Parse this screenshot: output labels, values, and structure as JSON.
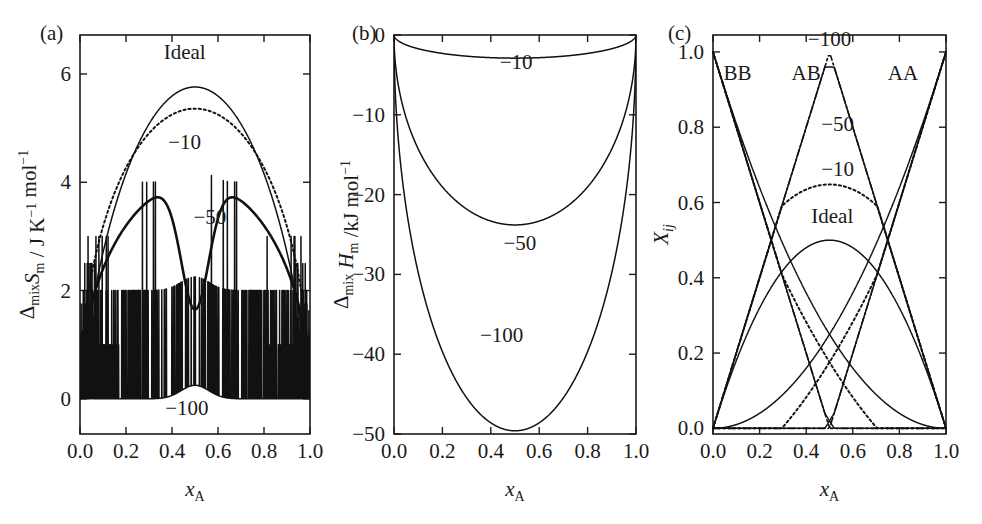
{
  "figure": {
    "background": "#ffffff",
    "line_color": "#111111",
    "partial_caption": ""
  },
  "panels": [
    {
      "id": "a",
      "label": "(a)",
      "xlabel_main": "x",
      "xlabel_sub": "A",
      "ylabel_parts": [
        {
          "text": "Δ",
          "kind": "normal"
        },
        {
          "text": "mix",
          "kind": "sub"
        },
        {
          "text": "S",
          "kind": "ital"
        },
        {
          "text": "m",
          "kind": "sub"
        },
        {
          "text": " / J K",
          "kind": "normal"
        },
        {
          "text": "−1",
          "kind": "sup"
        },
        {
          "text": " mol",
          "kind": "normal"
        },
        {
          "text": "−1",
          "kind": "sup"
        }
      ],
      "ylabel_plain": "Δmix Sm / J K−1 mol−1",
      "xticks": [
        "0.0",
        "0.2",
        "0.4",
        "0.6",
        "0.8",
        "1.0"
      ],
      "xtickvals": [
        0,
        0.2,
        0.4,
        0.6,
        0.8,
        1.0
      ],
      "yticks": [
        "0",
        "2",
        "4",
        "6"
      ],
      "ytickvals": [
        0,
        2,
        4,
        6
      ],
      "xlim": [
        0,
        1
      ],
      "ylim": [
        -0.65,
        6.72
      ],
      "curve_labels": [
        {
          "text": "Ideal",
          "x": 0.455,
          "y": 6.28
        },
        {
          "text": "−10",
          "x": 0.455,
          "y": 4.62
        },
        {
          "text": "−50",
          "x": 0.565,
          "y": 3.22
        },
        {
          "text": "−100",
          "x": 0.465,
          "y": -0.3
        }
      ]
    },
    {
      "id": "b",
      "label": "(b)",
      "xlabel_main": "x",
      "xlabel_sub": "A",
      "ylabel_parts": [
        {
          "text": "Δ",
          "kind": "normal"
        },
        {
          "text": "mix",
          "kind": "sub"
        },
        {
          "text": " H",
          "kind": "ital"
        },
        {
          "text": "m",
          "kind": "sub"
        },
        {
          "text": " /kJ mol",
          "kind": "normal"
        },
        {
          "text": "−1",
          "kind": "sup"
        }
      ],
      "ylabel_plain": "Δmix Hm /kJ mol−1",
      "xticks": [
        "0.0",
        "0.2",
        "0.4",
        "0.6",
        "0.8",
        "1.0"
      ],
      "xtickvals": [
        0,
        0.2,
        0.4,
        0.6,
        0.8,
        1.0
      ],
      "yticks": [
        "0",
        "−10",
        "−20",
        "−30",
        "−40",
        "−50"
      ],
      "ytickvals": [
        0,
        -10,
        -20,
        -30,
        -40,
        -50
      ],
      "xlim": [
        0,
        1
      ],
      "ylim": [
        -50,
        0
      ],
      "curve_labels": [
        {
          "text": "−10",
          "x": 0.505,
          "y": -4.3
        },
        {
          "text": "−50",
          "x": 0.52,
          "y": -27.0
        },
        {
          "text": "−100",
          "x": 0.445,
          "y": -38.5
        }
      ]
    },
    {
      "id": "c",
      "label": "(c)",
      "xlabel_main": "x",
      "xlabel_sub": "A",
      "ylabel_parts": [
        {
          "text": "X",
          "kind": "ital"
        },
        {
          "text": "ij",
          "kind": "subital"
        }
      ],
      "ylabel_plain": "Xij",
      "xticks": [
        "0.0",
        "0.2",
        "0.4",
        "0.6",
        "0.8",
        "1.0"
      ],
      "xtickvals": [
        0,
        0.2,
        0.4,
        0.6,
        0.8,
        1.0
      ],
      "yticks": [
        "0.0",
        "0.2",
        "0.4",
        "0.6",
        "0.8",
        "1.0"
      ],
      "ytickvals": [
        0,
        0.2,
        0.4,
        0.6,
        0.8,
        1.0
      ],
      "xlim": [
        0,
        1
      ],
      "ylim": [
        -0.015,
        1.045
      ],
      "curve_labels": [
        {
          "text": "BB",
          "x": 0.105,
          "y": 0.925
        },
        {
          "text": "AB",
          "x": 0.4,
          "y": 0.925
        },
        {
          "text": "AA",
          "x": 0.815,
          "y": 0.925
        },
        {
          "text": "−100",
          "x": 0.5,
          "y": 1.015
        },
        {
          "text": "−50",
          "x": 0.535,
          "y": 0.79
        },
        {
          "text": "−10",
          "x": 0.535,
          "y": 0.67
        },
        {
          "text": "Ideal",
          "x": 0.512,
          "y": 0.545
        }
      ]
    }
  ],
  "chart_data": [
    {
      "type": "line",
      "panel": "a",
      "title": "(a) Entropy of mixing",
      "xlabel": "x_A",
      "ylabel": "Δmix Sm / J K^-1 mol^-1",
      "xlim": [
        0,
        1
      ],
      "ylim": [
        0,
        6.2
      ],
      "grid": false,
      "legend": "inline-annotations",
      "x": [
        0.0,
        0.02,
        0.04,
        0.06,
        0.08,
        0.1,
        0.12,
        0.14,
        0.16,
        0.18,
        0.2,
        0.22,
        0.24,
        0.26,
        0.28,
        0.3,
        0.32,
        0.34,
        0.36,
        0.38,
        0.4,
        0.42,
        0.44,
        0.46,
        0.48,
        0.5,
        0.52,
        0.54,
        0.56,
        0.58,
        0.6,
        0.62,
        0.64,
        0.66,
        0.68,
        0.7,
        0.72,
        0.74,
        0.76,
        0.78,
        0.8,
        0.82,
        0.84,
        0.86,
        0.88,
        0.9,
        0.92,
        0.94,
        0.96,
        0.98,
        1.0
      ],
      "series": [
        {
          "name": "Ideal",
          "style": "solid",
          "values": [
            0.0,
            0.65,
            1.12,
            1.49,
            1.8,
            2.08,
            2.32,
            2.53,
            2.73,
            2.9,
            3.06,
            3.2,
            3.33,
            3.44,
            3.53,
            3.61,
            3.68,
            3.73,
            3.77,
            3.8,
            3.81,
            3.81,
            3.8,
            3.77,
            3.73,
            3.68,
            3.73,
            3.77,
            3.8,
            3.81,
            3.81,
            3.8,
            3.77,
            3.73,
            3.68,
            3.61,
            3.53,
            3.44,
            3.33,
            3.2,
            3.06,
            2.9,
            2.73,
            2.53,
            2.32,
            2.08,
            1.8,
            1.49,
            1.12,
            0.65,
            0.0
          ],
          "note": "ideal configurational entropy scaled; peak 5.76 J K-1 mol-1 at x=0.5",
          "peak": 5.76
        },
        {
          "name": "-10",
          "style": "dotted",
          "peak": 5.36,
          "note": "w = -10 kJ/mol; slightly reduced peak"
        },
        {
          "name": "-50",
          "style": "thick-solid",
          "peak": 4.0,
          "minimum_at_half": 1.65,
          "note": "w = -50 kJ/mol; double-humped with dip at x=0.5"
        },
        {
          "name": "-100",
          "style": "solid",
          "peak": 4.0,
          "minimum_at_half": 0.25,
          "note": "w = -100 kJ/mol; deep narrow dip at x=0.5"
        }
      ]
    },
    {
      "type": "line",
      "panel": "b",
      "title": "(b) Enthalpy of mixing",
      "xlabel": "x_A",
      "ylabel": "Δmix Hm /kJ mol^-1",
      "xlim": [
        0,
        1
      ],
      "ylim": [
        -50,
        0
      ],
      "grid": false,
      "legend": "inline-annotations",
      "series": [
        {
          "name": "-10",
          "style": "solid",
          "minimum_at_half": -2.9,
          "endpoints": [
            0,
            0
          ]
        },
        {
          "name": "-50",
          "style": "solid",
          "minimum_at_half": -23.8,
          "endpoints": [
            0,
            0
          ]
        },
        {
          "name": "-100",
          "style": "solid",
          "minimum_at_half": -49.6,
          "endpoints": [
            0,
            0
          ]
        }
      ]
    },
    {
      "type": "line",
      "panel": "c",
      "title": "(c) Pair fractions",
      "xlabel": "x_A",
      "ylabel": "X_ij",
      "xlim": [
        0,
        1
      ],
      "ylim": [
        0,
        1
      ],
      "grid": false,
      "legend": "inline-annotations",
      "series": [
        {
          "name": "BB Ideal",
          "style": "solid",
          "value_at_0": 1.0,
          "value_at_1": 0.0,
          "value_at_half": 0.25
        },
        {
          "name": "AA Ideal",
          "style": "solid",
          "value_at_0": 0.0,
          "value_at_1": 1.0,
          "value_at_half": 0.25
        },
        {
          "name": "AB Ideal",
          "style": "solid",
          "value_at_0": 0.0,
          "value_at_1": 0.0,
          "value_at_half": 0.5
        },
        {
          "name": "BB -10",
          "style": "dotted",
          "value_at_0": 1.0,
          "value_at_1": 0.0,
          "value_at_half": 0.175
        },
        {
          "name": "AA -10",
          "style": "dotted",
          "value_at_0": 0.0,
          "value_at_1": 1.0,
          "value_at_half": 0.175
        },
        {
          "name": "AB -10",
          "style": "dotted",
          "value_at_0": 0.0,
          "value_at_1": 0.0,
          "value_at_half": 0.648
        },
        {
          "name": "BB -50",
          "style": "solid",
          "value_at_0": 1.0,
          "value_at_1": 0.0,
          "value_at_half": 0.02
        },
        {
          "name": "AA -50",
          "style": "solid",
          "value_at_0": 0.0,
          "value_at_1": 1.0,
          "value_at_half": 0.02
        },
        {
          "name": "AB -50",
          "style": "solid",
          "value_at_0": 0.0,
          "value_at_1": 0.0,
          "value_at_half": 0.96
        },
        {
          "name": "BB -100",
          "style": "dashdot",
          "value_at_0": 1.0,
          "value_at_1": 0.0,
          "value_at_half": 0.005
        },
        {
          "name": "AA -100",
          "style": "dashdot",
          "value_at_0": 0.0,
          "value_at_1": 1.0,
          "value_at_half": 0.005
        },
        {
          "name": "AB -100",
          "style": "dashdot",
          "value_at_0": 0.0,
          "value_at_1": 0.0,
          "value_at_half": 0.99
        }
      ]
    }
  ],
  "geometry": {
    "panels": [
      {
        "id": "a",
        "x0": 80,
        "x1": 310,
        "y0": 35,
        "y1": 434
      },
      {
        "id": "b",
        "x0": 394,
        "x1": 636,
        "y0": 35,
        "y1": 434
      },
      {
        "id": "c",
        "x0": 713,
        "x1": 946,
        "y0": 35,
        "y1": 434
      }
    ]
  }
}
